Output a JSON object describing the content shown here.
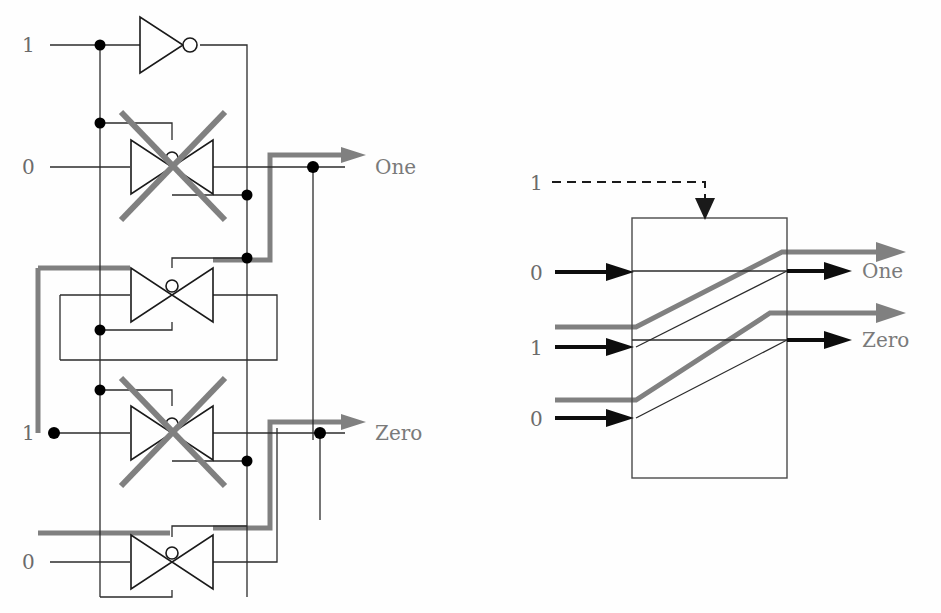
{
  "figure": {
    "colors": {
      "wire_black": "#1a1a1a",
      "wire_thin": "#2b2b2b",
      "highlight_gray": "#808080",
      "label_gray": "#6b6b6b",
      "background": "#fefefe",
      "node_fill": "#000000",
      "bubble_fill": "#ffffff"
    }
  },
  "left_circuit": {
    "name": "transmission-gate-circuit",
    "inputs": [
      {
        "id": "sel-top",
        "label": "1",
        "x": 30,
        "y": 52,
        "wire_y": 45
      },
      {
        "id": "data-in-a",
        "label": "0",
        "x": 30,
        "y": 174,
        "wire_y": 167
      },
      {
        "id": "data-in-b",
        "label": "1",
        "x": 30,
        "y": 440,
        "wire_y": 433
      },
      {
        "id": "data-in-c",
        "label": "0",
        "x": 30,
        "y": 569,
        "wire_y": 562
      }
    ],
    "outputs": [
      {
        "id": "out-one",
        "label": "One",
        "x": 375,
        "y": 174
      },
      {
        "id": "out-zero",
        "label": "Zero",
        "x": 375,
        "y": 440
      }
    ],
    "gates": [
      {
        "id": "inverter",
        "type": "inverter",
        "disabled": false,
        "cx": 175,
        "cy": 45
      },
      {
        "id": "tgate-1",
        "type": "transmission-gate",
        "disabled": true,
        "cx": 172,
        "cy": 167
      },
      {
        "id": "tgate-2",
        "type": "transmission-gate",
        "disabled": false,
        "cx": 172,
        "cy": 295
      },
      {
        "id": "tgate-3",
        "type": "transmission-gate",
        "disabled": true,
        "cx": 172,
        "cy": 433
      },
      {
        "id": "tgate-4",
        "type": "transmission-gate",
        "disabled": false,
        "cx": 172,
        "cy": 562
      }
    ],
    "junction_count": 9,
    "disabled_marker": "x-cross"
  },
  "right_block": {
    "name": "abstract-mux-block",
    "box": {
      "x": 632,
      "y": 218,
      "w": 155,
      "h": 260
    },
    "control": {
      "label": "1",
      "label_x": 537,
      "label_y": 190,
      "dashed": true,
      "arrow_dir": "down"
    },
    "inputs": [
      {
        "id": "in-sel-0",
        "label": "0",
        "x": 537,
        "y": 280,
        "wire_y": 272,
        "style": "black-arrow"
      },
      {
        "id": "in-gray-1",
        "label": "",
        "x": 0,
        "y": 327,
        "wire_y": 327,
        "style": "gray-line"
      },
      {
        "id": "in-sel-1",
        "label": "1",
        "x": 537,
        "y": 355,
        "wire_y": 347,
        "style": "black-arrow"
      },
      {
        "id": "in-gray-2",
        "label": "",
        "x": 0,
        "y": 400,
        "wire_y": 400,
        "style": "gray-line"
      },
      {
        "id": "in-sel-2",
        "label": "0",
        "x": 537,
        "y": 426,
        "wire_y": 418,
        "style": "black-arrow"
      }
    ],
    "outputs": [
      {
        "id": "out-gray-one",
        "label": "",
        "wire_y": 252,
        "style": "gray-arrow"
      },
      {
        "id": "out-one",
        "label": "One",
        "wire_y": 271,
        "style": "black-arrow",
        "label_x": 860,
        "label_y": 278
      },
      {
        "id": "out-gray-zero",
        "label": "",
        "wire_y": 313,
        "style": "gray-arrow"
      },
      {
        "id": "out-zero",
        "label": "Zero",
        "wire_y": 340,
        "style": "black-arrow",
        "label_x": 860,
        "label_y": 347
      }
    ],
    "internal_paths": [
      {
        "id": "path-gray-upper",
        "from_y": 327,
        "to_y": 252,
        "style": "gray-thick"
      },
      {
        "id": "path-thin-upper",
        "from_y": 347,
        "to_y": 271,
        "style": "thin-black"
      },
      {
        "id": "path-gray-lower",
        "from_y": 400,
        "to_y": 313,
        "style": "gray-thick"
      },
      {
        "id": "path-thin-lower",
        "from_y": 418,
        "to_y": 340,
        "style": "thin-black"
      }
    ]
  }
}
